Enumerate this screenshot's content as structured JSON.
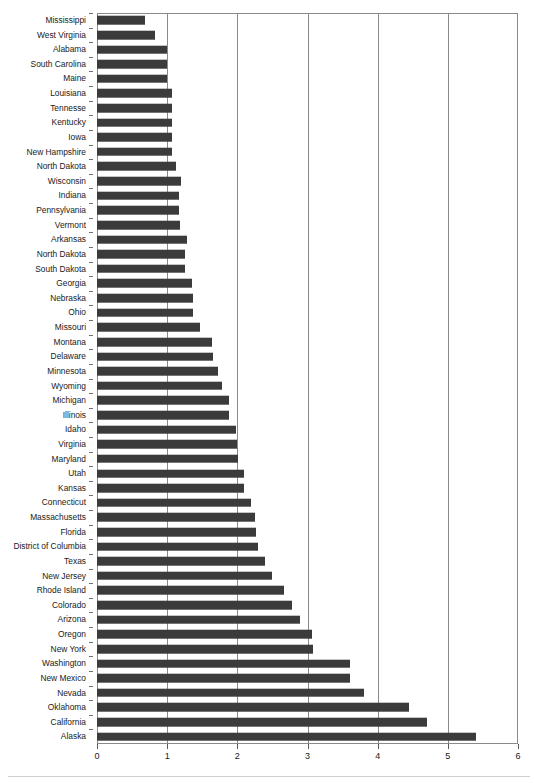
{
  "chart_data": {
    "type": "bar",
    "orientation": "horizontal",
    "title": "",
    "subtitle": "",
    "xlabel": "",
    "ylabel": "",
    "xlim": [
      0,
      6
    ],
    "ylim": null,
    "grid": true,
    "grid_axis": "x",
    "legend": null,
    "legend_position": "none",
    "xticks": [
      0,
      1,
      2,
      3,
      4,
      5,
      6
    ],
    "xtick_labels": [
      "0",
      "1",
      "2",
      "3",
      "4",
      "5",
      "6"
    ],
    "bar_color": "#3b3b3b",
    "axis_color": "#8a8a8a",
    "background_color": "#ffffff",
    "categories": [
      "Mississippi",
      "West Virginia",
      "Alabama",
      "South Carolina",
      "Maine",
      "Louisiana",
      "Tennesse",
      "Kentucky",
      "Iowa",
      "New Hampshire",
      "North Dakota",
      "Wisconsin",
      "Indiana",
      "Pennsylvania",
      "Vermont",
      "Arkansas",
      "North Dakota",
      "South Dakota",
      "Georgia",
      "Nebraska",
      "Ohio",
      "Missouri",
      "Montana",
      "Delaware",
      "Minnesota",
      "Wyoming",
      "Michigan",
      "Illinois",
      "Idaho",
      "Virginia",
      "Maryland",
      "Utah",
      "Kansas",
      "Connecticut",
      "Massachusetts",
      "Florida",
      "District of Columbia",
      "Texas",
      "New Jersey",
      "Rhode Island",
      "Colorado",
      "Arizona",
      "Oregon",
      "New York",
      "Washington",
      "New Mexico",
      "Nevada",
      "Oklahoma",
      "California",
      "Alaska"
    ],
    "values": [
      0.68,
      0.83,
      1.0,
      1.0,
      1.0,
      1.07,
      1.07,
      1.07,
      1.07,
      1.07,
      1.13,
      1.2,
      1.17,
      1.17,
      1.18,
      1.28,
      1.26,
      1.26,
      1.35,
      1.37,
      1.37,
      1.47,
      1.64,
      1.65,
      1.72,
      1.78,
      1.88,
      1.88,
      1.98,
      2.0,
      2.01,
      2.09,
      2.1,
      2.2,
      2.25,
      2.26,
      2.3,
      2.4,
      2.5,
      2.66,
      2.78,
      2.89,
      3.06,
      3.08,
      3.6,
      3.6,
      3.8,
      4.45,
      4.7,
      5.4
    ]
  }
}
